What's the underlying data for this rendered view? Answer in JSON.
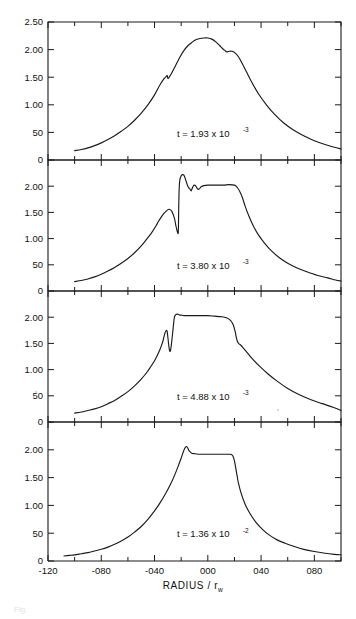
{
  "figure": {
    "kind": "multi-panel-line-plot",
    "panel_count": 4,
    "axis": {
      "x_title_main": "RADIUS /",
      "x_title_sub_var": "r",
      "x_title_sub_idx": "w",
      "x_ticks": [
        "-120",
        "-080",
        "-040",
        "000",
        "040",
        "080"
      ],
      "x_tick_values": [
        -120,
        -80,
        -40,
        0,
        40,
        80
      ],
      "x_minor_per_interval": 1,
      "xlim": [
        -120,
        100
      ],
      "y_ticks_top_panel": [
        "2.50",
        "2.00",
        "1.50",
        "1.00",
        "50",
        "0"
      ],
      "y_ticks_other_panels": [
        "2.00",
        "1.50",
        "1.00",
        "50",
        "0"
      ],
      "y_tick_values_top": [
        2.5,
        2.0,
        1.5,
        1.0,
        0.5,
        0.0
      ],
      "y_tick_values_other": [
        2.0,
        1.5,
        1.0,
        0.5,
        0.0
      ],
      "ylim": [
        0,
        2.5
      ],
      "grid": false
    },
    "caption_faint": "Fig."
  },
  "chart_data": [
    {
      "type": "line",
      "panel_index": 0,
      "title": "",
      "annotation": {
        "prefix": "t = ",
        "mantissa": "1.93",
        "times": " x 10",
        "exponent": "-3"
      },
      "xlabel": "RADIUS / r_w",
      "ylabel": "",
      "xlim": [
        -120,
        100
      ],
      "ylim": [
        0,
        2.5
      ],
      "peak_value": 2.21,
      "peak_x": -4,
      "x": [
        -100,
        -95,
        -90,
        -85,
        -80,
        -75,
        -70,
        -65,
        -60,
        -55,
        -50,
        -45,
        -40,
        -36,
        -33,
        -31,
        -30.5,
        -30,
        -29,
        -27,
        -24,
        -21,
        -18,
        -15,
        -12,
        -9,
        -6,
        -3,
        0,
        3,
        6,
        9,
        11,
        13,
        14,
        15,
        16,
        18,
        20,
        23,
        26,
        29,
        33,
        38,
        44,
        50,
        57,
        64,
        72,
        80,
        88,
        95,
        100
      ],
      "y": [
        0.17,
        0.19,
        0.22,
        0.26,
        0.31,
        0.37,
        0.44,
        0.52,
        0.61,
        0.72,
        0.85,
        1.0,
        1.18,
        1.36,
        1.47,
        1.52,
        1.53,
        1.48,
        1.5,
        1.58,
        1.72,
        1.86,
        1.98,
        2.07,
        2.13,
        2.18,
        2.2,
        2.21,
        2.21,
        2.19,
        2.14,
        2.07,
        2.02,
        1.98,
        1.96,
        1.96,
        1.97,
        1.97,
        1.95,
        1.87,
        1.74,
        1.6,
        1.41,
        1.2,
        1.0,
        0.83,
        0.67,
        0.55,
        0.44,
        0.35,
        0.28,
        0.23,
        0.2
      ]
    },
    {
      "type": "line",
      "panel_index": 1,
      "title": "",
      "annotation": {
        "prefix": "t = ",
        "mantissa": "3.80",
        "times": " x 10",
        "exponent": "-3"
      },
      "xlabel": "RADIUS / r_w",
      "ylabel": "",
      "xlim": [
        -120,
        100
      ],
      "ylim": [
        0,
        2.5
      ],
      "peak_value": 2.22,
      "peak_x": -18,
      "shock_jump_x": -22,
      "x": [
        -100,
        -95,
        -90,
        -85,
        -80,
        -75,
        -70,
        -65,
        -60,
        -55,
        -50,
        -45,
        -42,
        -39,
        -37,
        -35,
        -33,
        -31,
        -29,
        -27,
        -25,
        -24,
        -23,
        -22.5,
        -22.2,
        -22.0,
        -21.8,
        -21.5,
        -21,
        -20,
        -19,
        -18,
        -17,
        -16,
        -15,
        -14,
        -13,
        -12.5,
        -12,
        -11,
        -10,
        -9,
        -8,
        -7,
        -6,
        -5,
        -3,
        0,
        4,
        8,
        12,
        16,
        20,
        22,
        24,
        26,
        28,
        31,
        34,
        38,
        43,
        48,
        54,
        60,
        67,
        74,
        82,
        90,
        96,
        100
      ],
      "y": [
        0.18,
        0.2,
        0.23,
        0.27,
        0.32,
        0.38,
        0.45,
        0.53,
        0.62,
        0.73,
        0.86,
        1.02,
        1.12,
        1.24,
        1.33,
        1.41,
        1.48,
        1.53,
        1.56,
        1.52,
        1.38,
        1.25,
        1.14,
        1.1,
        1.12,
        1.3,
        1.65,
        1.95,
        2.12,
        2.2,
        2.22,
        2.21,
        2.15,
        2.07,
        2.0,
        1.96,
        1.93,
        1.91,
        1.94,
        2.0,
        2.02,
        2.0,
        1.96,
        1.94,
        1.96,
        1.99,
        2.01,
        2.02,
        2.02,
        2.02,
        2.02,
        2.03,
        2.02,
        1.98,
        1.9,
        1.78,
        1.62,
        1.42,
        1.25,
        1.07,
        0.9,
        0.76,
        0.63,
        0.53,
        0.44,
        0.37,
        0.3,
        0.25,
        0.21,
        0.19
      ]
    },
    {
      "type": "line",
      "panel_index": 2,
      "title": "",
      "annotation": {
        "prefix": "t = ",
        "mantissa": "4.88",
        "times": " x 10",
        "exponent": "-3"
      },
      "xlabel": "RADIUS / r_w",
      "ylabel": "",
      "xlim": [
        -120,
        100
      ],
      "ylim": [
        0,
        2.5
      ],
      "peak_value": 2.06,
      "plateau_value": 2.03,
      "x": [
        -100,
        -95,
        -90,
        -85,
        -80,
        -75,
        -70,
        -65,
        -60,
        -55,
        -50,
        -46,
        -43,
        -40,
        -38,
        -36,
        -34,
        -33,
        -32,
        -31,
        -30.5,
        -30,
        -29.5,
        -29,
        -28.5,
        -28,
        -27.5,
        -27,
        -26.5,
        -26,
        -25.5,
        -25,
        -24,
        -23,
        -22,
        -21,
        -20,
        -18,
        -15,
        -10,
        -5,
        0,
        5,
        10,
        14,
        17,
        19,
        20.5,
        21.5,
        22.5,
        23.5,
        25,
        27,
        30,
        34,
        39,
        45,
        52,
        60,
        68,
        77,
        86,
        94,
        100
      ],
      "y": [
        0.17,
        0.19,
        0.22,
        0.25,
        0.29,
        0.35,
        0.41,
        0.49,
        0.58,
        0.69,
        0.82,
        0.94,
        1.05,
        1.17,
        1.27,
        1.38,
        1.52,
        1.62,
        1.71,
        1.75,
        1.72,
        1.62,
        1.5,
        1.4,
        1.35,
        1.37,
        1.45,
        1.56,
        1.68,
        1.8,
        1.92,
        2.01,
        2.05,
        2.06,
        2.05,
        2.04,
        2.04,
        2.03,
        2.03,
        2.03,
        2.03,
        2.03,
        2.02,
        2.01,
        1.99,
        1.94,
        1.86,
        1.73,
        1.6,
        1.52,
        1.49,
        1.46,
        1.4,
        1.31,
        1.19,
        1.06,
        0.92,
        0.78,
        0.64,
        0.53,
        0.43,
        0.35,
        0.28,
        0.22,
        0.19
      ]
    },
    {
      "type": "line",
      "panel_index": 3,
      "title": "",
      "annotation": {
        "prefix": "t = ",
        "mantissa": "1.36",
        "times": " x 10",
        "exponent": "-2"
      },
      "xlabel": "RADIUS / r_w",
      "ylabel": "",
      "xlim": [
        -120,
        100
      ],
      "ylim": [
        0,
        2.5
      ],
      "peak_value": 2.06,
      "peak_x": -16,
      "x": [
        -108,
        -104,
        -100,
        -95,
        -90,
        -85,
        -80,
        -75,
        -70,
        -65,
        -60,
        -55,
        -50,
        -45,
        -40,
        -36,
        -32,
        -28,
        -25,
        -22,
        -20,
        -18,
        -17,
        -16,
        -15,
        -14,
        -12,
        -10,
        -7,
        -4,
        0,
        4,
        8,
        12,
        15,
        17,
        18,
        19,
        20,
        21,
        22,
        23,
        25,
        28,
        32,
        36,
        41,
        46,
        52,
        58,
        65,
        72,
        80,
        88,
        95,
        100
      ],
      "y": [
        0.09,
        0.1,
        0.11,
        0.13,
        0.15,
        0.18,
        0.21,
        0.25,
        0.3,
        0.36,
        0.43,
        0.52,
        0.62,
        0.75,
        0.9,
        1.04,
        1.2,
        1.38,
        1.54,
        1.72,
        1.85,
        1.99,
        2.04,
        2.06,
        2.03,
        1.98,
        1.94,
        1.93,
        1.92,
        1.92,
        1.92,
        1.92,
        1.92,
        1.92,
        1.92,
        1.92,
        1.91,
        1.88,
        1.8,
        1.67,
        1.53,
        1.4,
        1.22,
        1.02,
        0.84,
        0.7,
        0.57,
        0.47,
        0.38,
        0.32,
        0.26,
        0.21,
        0.17,
        0.14,
        0.12,
        0.11
      ]
    }
  ]
}
